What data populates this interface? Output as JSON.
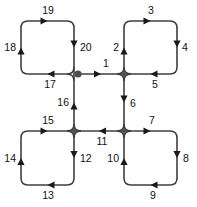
{
  "diagram": {
    "type": "directed-graph",
    "canvas": {
      "width": 197,
      "height": 207
    },
    "colors": {
      "background": "#ffffff",
      "line": "#3f3f3f",
      "arrow": "#1a1a1a",
      "label": "#111111",
      "start_dot": "#4d4d4d"
    },
    "start_marker": {
      "name": "start-dot",
      "cx": 78,
      "cy": 74,
      "r": 3.6
    },
    "grid": {
      "x": [
        21,
        74,
        124,
        177
      ],
      "y": [
        21,
        74,
        131,
        185
      ]
    },
    "edges": [
      {
        "id": 1,
        "label": "1",
        "x1": 78,
        "y1": 74,
        "x2": 124,
        "y2": 74,
        "dir": "right",
        "lx": 106,
        "ly": 64,
        "anchor": "mid"
      },
      {
        "id": 2,
        "label": "2",
        "x1": 124,
        "y1": 74,
        "x2": 124,
        "y2": 21,
        "dir": "up",
        "lx": 119,
        "ly": 48,
        "anchor": "end"
      },
      {
        "id": 3,
        "label": "3",
        "x1": 124,
        "y1": 21,
        "x2": 177,
        "y2": 21,
        "dir": "right",
        "lx": 151,
        "ly": 11,
        "anchor": "mid"
      },
      {
        "id": 4,
        "label": "4",
        "x1": 177,
        "y1": 21,
        "x2": 177,
        "y2": 74,
        "dir": "down",
        "lx": 182,
        "ly": 48,
        "anchor": "start"
      },
      {
        "id": 5,
        "label": "5",
        "x1": 177,
        "y1": 74,
        "x2": 124,
        "y2": 74,
        "dir": "left",
        "lx": 155,
        "ly": 85,
        "anchor": "mid"
      },
      {
        "id": 6,
        "label": "6",
        "x1": 124,
        "y1": 74,
        "x2": 124,
        "y2": 131,
        "dir": "down",
        "lx": 130,
        "ly": 104,
        "anchor": "start"
      },
      {
        "id": 7,
        "label": "7",
        "x1": 124,
        "y1": 131,
        "x2": 177,
        "y2": 131,
        "dir": "right",
        "lx": 152,
        "ly": 121,
        "anchor": "mid"
      },
      {
        "id": 8,
        "label": "8",
        "x1": 177,
        "y1": 131,
        "x2": 177,
        "y2": 185,
        "dir": "down",
        "lx": 183,
        "ly": 159,
        "anchor": "start"
      },
      {
        "id": 9,
        "label": "9",
        "x1": 177,
        "y1": 185,
        "x2": 124,
        "y2": 185,
        "dir": "left",
        "lx": 153,
        "ly": 196,
        "anchor": "mid"
      },
      {
        "id": 10,
        "label": "10",
        "x1": 124,
        "y1": 185,
        "x2": 124,
        "y2": 131,
        "dir": "up",
        "lx": 119,
        "ly": 159,
        "anchor": "end"
      },
      {
        "id": 11,
        "label": "11",
        "x1": 124,
        "y1": 131,
        "x2": 74,
        "y2": 131,
        "dir": "left",
        "lx": 102,
        "ly": 142,
        "anchor": "mid"
      },
      {
        "id": 12,
        "label": "12",
        "x1": 74,
        "y1": 131,
        "x2": 74,
        "y2": 185,
        "dir": "down",
        "lx": 80,
        "ly": 159,
        "anchor": "start"
      },
      {
        "id": 13,
        "label": "13",
        "x1": 74,
        "y1": 185,
        "x2": 21,
        "y2": 185,
        "dir": "left",
        "lx": 48,
        "ly": 196,
        "anchor": "mid"
      },
      {
        "id": 14,
        "label": "14",
        "x1": 21,
        "y1": 185,
        "x2": 21,
        "y2": 131,
        "dir": "up",
        "lx": 16,
        "ly": 159,
        "anchor": "end"
      },
      {
        "id": 15,
        "label": "15",
        "x1": 21,
        "y1": 131,
        "x2": 74,
        "y2": 131,
        "dir": "right",
        "lx": 48,
        "ly": 121,
        "anchor": "mid"
      },
      {
        "id": 16,
        "label": "16",
        "x1": 74,
        "y1": 131,
        "x2": 74,
        "y2": 74,
        "dir": "up",
        "lx": 69,
        "ly": 103,
        "anchor": "end"
      },
      {
        "id": 17,
        "label": "17",
        "x1": 74,
        "y1": 74,
        "x2": 21,
        "y2": 74,
        "dir": "left",
        "lx": 50,
        "ly": 85,
        "anchor": "mid"
      },
      {
        "id": 18,
        "label": "18",
        "x1": 21,
        "y1": 74,
        "x2": 21,
        "y2": 21,
        "dir": "up",
        "lx": 16,
        "ly": 48,
        "anchor": "end"
      },
      {
        "id": 19,
        "label": "19",
        "x1": 21,
        "y1": 21,
        "x2": 74,
        "y2": 21,
        "dir": "right",
        "lx": 48,
        "ly": 11,
        "anchor": "mid"
      },
      {
        "id": 20,
        "label": "20",
        "x1": 74,
        "y1": 21,
        "x2": 74,
        "y2": 74,
        "dir": "down",
        "lx": 80,
        "ly": 48,
        "anchor": "start"
      }
    ]
  }
}
